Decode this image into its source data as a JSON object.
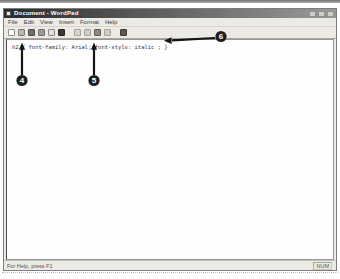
{
  "window": {
    "title": "Document - WordPad",
    "menus": [
      "File",
      "Edit",
      "View",
      "Insert",
      "Format",
      "Help"
    ],
    "toolbar_icons": [
      "new-document",
      "open",
      "save",
      "print",
      "print-preview",
      "find",
      "cut",
      "copy",
      "paste",
      "undo",
      "date-time"
    ],
    "controls": [
      "minimize",
      "maximize",
      "close"
    ],
    "document_text": "h2 { font-family: Arial; font-style: italic ; }",
    "statusbar": {
      "help_text": "For Help, press F1",
      "num_lock": "NUM"
    }
  },
  "callouts": {
    "items": [
      "4",
      "5",
      "6"
    ]
  },
  "colors": {
    "titlebar_start": "#2c2c2c",
    "titlebar_end": "#9a9a9a",
    "callout_fill": "#1f1f1f",
    "arrow": "#141414",
    "document_bg": "#fefefe",
    "chrome_bg": "#eceae4"
  }
}
